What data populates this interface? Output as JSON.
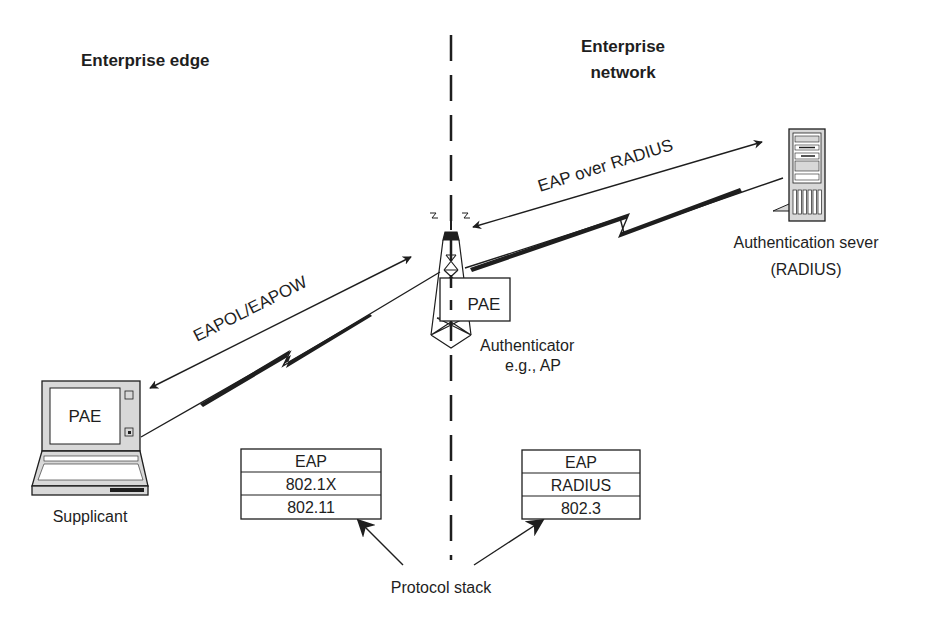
{
  "regions": {
    "edge": "Enterprise edge",
    "network_line1": "Enterprise",
    "network_line2": "network"
  },
  "links": {
    "eapol": "EAPOL/EAPOW",
    "eap_radius": "EAP over RADIUS"
  },
  "supplicant": {
    "screen_label": "PAE",
    "caption": "Supplicant"
  },
  "authenticator": {
    "box_label": "PAE",
    "caption_line1": "Authenticator",
    "caption_line2": "e.g., AP"
  },
  "server": {
    "caption_line1": "Authentication sever",
    "caption_line2": "(RADIUS)"
  },
  "stacks": {
    "left": [
      "EAP",
      "802.1X",
      "802.11"
    ],
    "right": [
      "EAP",
      "RADIUS",
      "802.3"
    ],
    "caption": "Protocol stack"
  },
  "colors": {
    "ink": "#1e1e1e",
    "device_fill": "#d8d8d8",
    "background": "#ffffff"
  }
}
